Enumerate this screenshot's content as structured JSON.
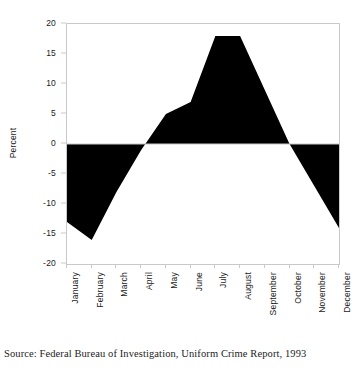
{
  "chart_data": {
    "type": "area",
    "title": "",
    "subtitle": "",
    "xlabel": "",
    "ylabel": "Percent",
    "categories": [
      "January",
      "February",
      "March",
      "April",
      "May",
      "June",
      "July",
      "August",
      "September",
      "October",
      "November",
      "December"
    ],
    "values": [
      -13,
      -16,
      -8,
      -1,
      5,
      7,
      18,
      18,
      9,
      0,
      -7,
      -14
    ],
    "series": [
      {
        "name": "Percent difference from average",
        "values": [
          -13,
          -16,
          -8,
          -1,
          5,
          7,
          18,
          18,
          9,
          0,
          -7,
          -14
        ]
      }
    ],
    "ylim": [
      -20,
      20
    ],
    "y_ticks": [
      20,
      15,
      10,
      5,
      0,
      -5,
      -10,
      -15,
      -20
    ],
    "y_tick_labels": [
      "20",
      "15",
      "10",
      "5",
      "0",
      "-5",
      "-10",
      "-15",
      "-20"
    ],
    "grid": false,
    "legend": "none",
    "fill_color": "#000000",
    "axis_color": "#c9c9c9",
    "baseline_value": 0
  },
  "caption": {
    "source": "Source: Federal Bureau of Investigation, Uniform Crime Report, 1993"
  }
}
